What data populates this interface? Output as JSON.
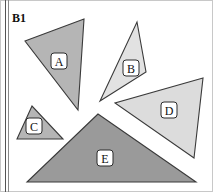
{
  "panel": {
    "title": "B1",
    "width": 192,
    "height": 192,
    "background_color": "#ffffff",
    "border_color": "#c8c8c8"
  },
  "margin_rules": [
    {
      "name": "outer-rule",
      "x": 5,
      "color": "#555555"
    },
    {
      "name": "inner-rule",
      "x": 8,
      "color": "#8a8a8a"
    }
  ],
  "shapes": [
    {
      "id": "A",
      "label": "A",
      "type": "triangle",
      "fill": "#b5b5b5",
      "stroke": "#3a3a3a",
      "points": "84,19 25,41 78,110",
      "label_x": 59,
      "label_y": 61
    },
    {
      "id": "B",
      "label": "B",
      "type": "triangle",
      "fill": "#e2e2e2",
      "stroke": "#3a3a3a",
      "points": "137,22 146,72 100,101",
      "label_x": 131,
      "label_y": 68
    },
    {
      "id": "C",
      "label": "C",
      "type": "triangle",
      "fill": "#b5b5b5",
      "stroke": "#3a3a3a",
      "points": "32,106 17,139 63,139",
      "label_x": 34,
      "label_y": 126
    },
    {
      "id": "D",
      "label": "D",
      "type": "triangle",
      "fill": "#dcdcdc",
      "stroke": "#3a3a3a",
      "points": "203,78 115,103 194,158",
      "label_x": 169,
      "label_y": 110
    },
    {
      "id": "E",
      "label": "E",
      "type": "triangle",
      "fill": "#9a9a9a",
      "stroke": "#3a3a3a",
      "points": "98,114 27,182 196,182",
      "label_x": 105,
      "label_y": 158
    }
  ]
}
